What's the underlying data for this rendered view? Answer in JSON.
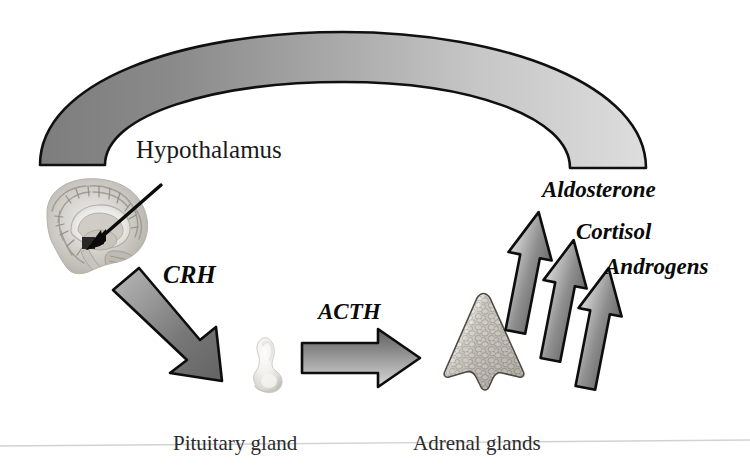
{
  "figure": {
    "background_color": "#ffffff"
  },
  "labels": {
    "hypothalamus": "Hypothalamus",
    "crh": "CRH",
    "acth": "ACTH",
    "aldosterone": "Aldosterone",
    "cortisol": "Cortisol",
    "androgens": "Androgens",
    "pituitary_gland": "Pituitary gland",
    "adrenal_glands": "Adrenal glands"
  },
  "colors": {
    "outline": "#111111",
    "arc_left": "#828282",
    "arc_right": "#d8d8d8",
    "arrow_dark": "#6e6e6e",
    "arrow_light": "#d6d6d6",
    "text": "#1a1a1a",
    "footer_rule": "#cfcfcf"
  },
  "graphics": {
    "feedback_arc": {
      "name": "feedback-arc",
      "description": "thick open arc spanning top of figure, gradient dark gray at left end to light gray at right end",
      "left_end_color": "#828282",
      "right_end_color": "#d8d8d8"
    },
    "brain_image": {
      "name": "brain-sagittal-image",
      "description": "grayscale mid-sagittal MRI of brain with pointer arrow to hypothalamus"
    },
    "pointer_arrow": {
      "name": "hypothalamus-pointer-arrow",
      "description": "thin black arrow pointing down-left into the brain image"
    },
    "crh_arrow": {
      "name": "crh-arrow",
      "description": "diagonal gradient block arrow pointing down-right from brain to pituitary"
    },
    "pituitary_image": {
      "name": "pituitary-gland-image",
      "description": "small pale bilobed gland"
    },
    "acth_arrow": {
      "name": "acth-arrow",
      "description": "horizontal gradient block arrow pointing right from pituitary to adrenal"
    },
    "adrenal_image": {
      "name": "adrenal-gland-image",
      "description": "triangular pyramid-shaped gland with cobblestone cellular texture"
    },
    "hormone_arrows": [
      {
        "name": "aldosterone-arrow",
        "label_ref": "aldosterone"
      },
      {
        "name": "cortisol-arrow",
        "label_ref": "cortisol"
      },
      {
        "name": "androgens-arrow",
        "label_ref": "androgens"
      }
    ],
    "footer_rule": {
      "name": "footer-rule",
      "description": "faint horizontal hairline across the lower portion of the figure"
    }
  }
}
